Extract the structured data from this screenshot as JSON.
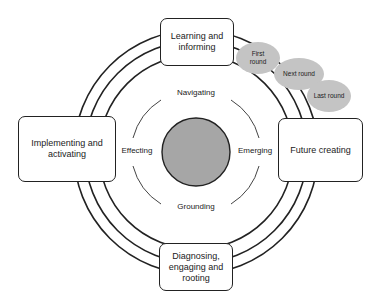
{
  "diagram": {
    "boxes": {
      "top": "Learning and informing",
      "left": "Implementing and activating",
      "right": "Future creating",
      "bottom": "Diagnosing, engaging and rooting"
    },
    "inner_labels": {
      "top": "Navigating",
      "left": "Effecting",
      "right": "Emerging",
      "bottom": "Grounding"
    },
    "rounds": [
      "First round",
      "Next round",
      "Last round"
    ],
    "colors": {
      "core_fill": "#a6a6a6",
      "bubble_fill": "#c4c4c4",
      "stroke": "#222222"
    }
  }
}
